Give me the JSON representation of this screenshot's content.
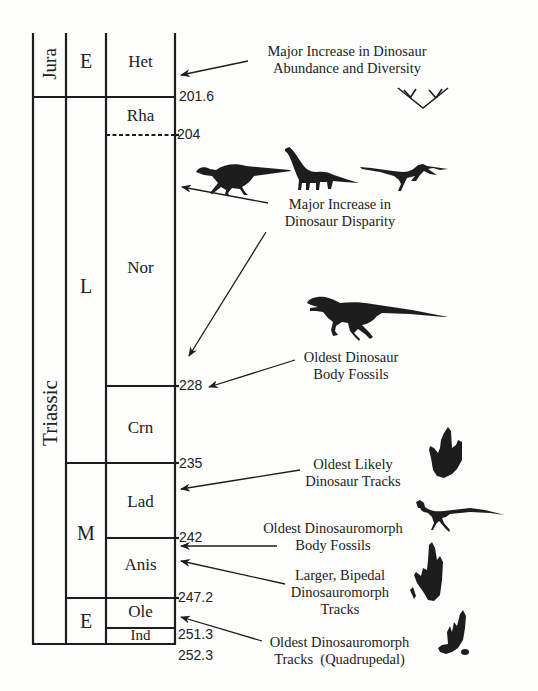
{
  "figure": {
    "colors": {
      "ink": "#1d1d1d",
      "background": "#fdfdfc"
    }
  },
  "timescale": {
    "periods": [
      {
        "name": "Jura",
        "orientation": "vertical"
      },
      {
        "name": "Triassic",
        "orientation": "vertical"
      }
    ],
    "epochs": [
      {
        "name": "E",
        "period": "Jurassic"
      },
      {
        "name": "L",
        "period": "Triassic"
      },
      {
        "name": "M",
        "period": "Triassic"
      },
      {
        "name": "E",
        "period": "Triassic"
      }
    ],
    "stages": [
      {
        "name": "Het"
      },
      {
        "name": "Rha"
      },
      {
        "name": "Nor"
      },
      {
        "name": "Crn"
      },
      {
        "name": "Lad"
      },
      {
        "name": "Anis"
      },
      {
        "name": "Ole"
      },
      {
        "name": "Ind"
      }
    ],
    "boundaries_ma": [
      {
        "value": "201.6",
        "style": "solid"
      },
      {
        "value": "204",
        "style": "dashed"
      },
      {
        "value": "228",
        "style": "solid"
      },
      {
        "value": "235",
        "style": "solid"
      },
      {
        "value": "242",
        "style": "solid"
      },
      {
        "value": "247.2",
        "style": "solid"
      },
      {
        "value": "251.3",
        "style": "solid"
      },
      {
        "value": "252.3",
        "style": "solid"
      }
    ]
  },
  "events": [
    {
      "line1": "Major Increase in Dinosaur",
      "line2": "Abundance and Diversity",
      "icon": "cladogram-icon"
    },
    {
      "line1": "Major Increase in",
      "line2": "Dinosaur Disparity",
      "icon": "sauropodomorph-ornithischian-theropod-silhouettes"
    },
    {
      "line1": "Oldest Dinosaur",
      "line2": "Body Fossils",
      "icon": "theropod-silhouette"
    },
    {
      "line1": "Oldest Likely",
      "line2": "Dinosaur Tracks",
      "icon": "tridactyl-footprint"
    },
    {
      "line1": "Oldest Dinosauromorph",
      "line2": "Body Fossils",
      "icon": "small-dinosauromorph-silhouette"
    },
    {
      "line1": "Larger, Bipedal",
      "line2": "Dinosauromorph",
      "line3": "Tracks",
      "icon": "bipedal-footprint"
    },
    {
      "line1": "Oldest Dinosauromorph",
      "line2": "Tracks  (Quadrupedal)",
      "icon": "quadrupedal-footprint"
    }
  ]
}
